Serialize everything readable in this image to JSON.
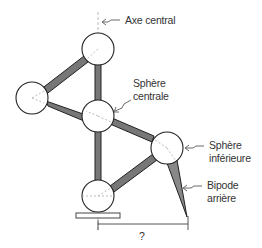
{
  "diagram": {
    "labels": {
      "axis": "Axe central",
      "central_sphere_line1": "Sphère",
      "central_sphere_line2": "centrale",
      "lower_sphere_line1": "Sphère",
      "lower_sphere_line2": "inférieure",
      "bipod_line1": "Bipode",
      "bipod_line2": "arrière",
      "dimension": "?"
    },
    "spheres": [
      {
        "name": "top-sphere",
        "cx": 98,
        "cy": 49
      },
      {
        "name": "left-sphere",
        "cx": 32,
        "cy": 98
      },
      {
        "name": "central-sphere",
        "cx": 98,
        "cy": 116
      },
      {
        "name": "lower-sphere",
        "cx": 167,
        "cy": 148
      },
      {
        "name": "bottom-sphere",
        "cx": 98,
        "cy": 196
      }
    ],
    "colors": {
      "stroke": "#222222",
      "tube_fill": "#777777",
      "dash": "#999999"
    }
  }
}
